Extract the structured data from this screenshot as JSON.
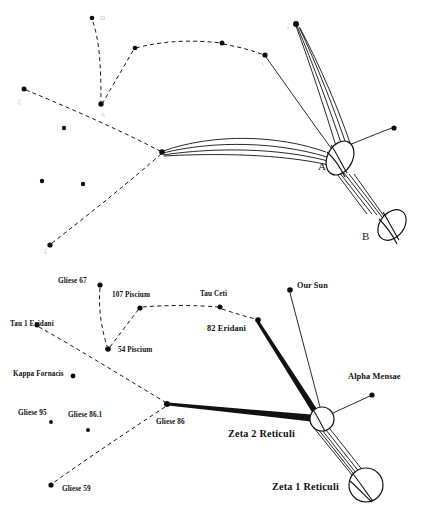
{
  "figure": {
    "background_color": "#ffffff",
    "ink_color": "#111111",
    "faint_ink_color": "#bdbdbd"
  },
  "upper_panel": {
    "name": "upper-sketch-panel",
    "object_labels": [
      {
        "id": "obj-a",
        "text": "A",
        "x": 318,
        "y": 170
      },
      {
        "id": "obj-b",
        "text": "B",
        "x": 362,
        "y": 240
      }
    ],
    "faint_labels": [
      {
        "id": "faint-d",
        "text": "D",
        "x": 100,
        "y": 20
      },
      {
        "id": "faint-zeta-left",
        "text": "ζ",
        "x": 18,
        "y": 104
      },
      {
        "id": "faint-c-bottom",
        "text": "ζ",
        "x": 44,
        "y": 253
      },
      {
        "id": "faint-upper-right-1",
        "text": "ι",
        "x": 287,
        "y": 30
      },
      {
        "id": "faint-upper-right-2",
        "text": "ι",
        "x": 262,
        "y": 66
      },
      {
        "id": "faint-node-low",
        "text": "η",
        "x": 101,
        "y": 116
      }
    ],
    "stars": [
      {
        "id": "u-star-1",
        "x": 92,
        "y": 18,
        "r": 2.3
      },
      {
        "id": "u-star-2",
        "x": 101,
        "y": 104,
        "r": 2.7
      },
      {
        "id": "u-star-3",
        "x": 135,
        "y": 48,
        "r": 2.3
      },
      {
        "id": "u-star-4",
        "x": 222,
        "y": 43,
        "r": 2.5
      },
      {
        "id": "u-star-5",
        "x": 265,
        "y": 55,
        "r": 2.6
      },
      {
        "id": "u-star-6",
        "x": 24,
        "y": 89,
        "r": 2.5
      },
      {
        "id": "u-star-7",
        "x": 64,
        "y": 128,
        "r": 2.2
      },
      {
        "id": "u-star-8",
        "x": 42,
        "y": 181,
        "r": 2.2
      },
      {
        "id": "u-star-9",
        "x": 83,
        "y": 184,
        "r": 2.2
      },
      {
        "id": "u-star-10",
        "x": 50,
        "y": 245,
        "r": 2.6
      },
      {
        "id": "u-star-11",
        "x": 162,
        "y": 152,
        "r": 2.8
      },
      {
        "id": "u-star-12",
        "x": 295,
        "y": 24,
        "r": 3.0
      },
      {
        "id": "u-star-13",
        "x": 394,
        "y": 128,
        "r": 2.6
      }
    ]
  },
  "lower_panel": {
    "name": "lower-star-map-panel",
    "stars": [
      {
        "id": "gliese-67",
        "label": "Gliese 67",
        "x": 100,
        "y": 285,
        "lx": 58,
        "ly": 283,
        "r": 2.6,
        "size": "small"
      },
      {
        "id": "piscium-107",
        "label": "107 Piscium",
        "x": 140,
        "y": 308,
        "lx": 112,
        "ly": 297,
        "r": 2.6,
        "size": "small"
      },
      {
        "id": "piscium-54",
        "label": "54 Piscium",
        "x": 108,
        "y": 349,
        "lx": 118,
        "ly": 352,
        "r": 2.8,
        "size": "small"
      },
      {
        "id": "tau-ceti",
        "label": "Tau Ceti",
        "x": 220,
        "y": 307,
        "lx": 200,
        "ly": 296,
        "r": 2.5,
        "size": "small"
      },
      {
        "id": "tau-1-eridani",
        "label": "Tau 1 Eridani",
        "x": 37,
        "y": 325,
        "lx": 10,
        "ly": 326,
        "r": 2.5,
        "size": "small"
      },
      {
        "id": "kappa-fornacis",
        "label": "Kappa Fornacis",
        "x": 73,
        "y": 376,
        "lx": 13,
        "ly": 376,
        "r": 2.4,
        "size": "small"
      },
      {
        "id": "gliese-95",
        "label": "Gliese 95",
        "x": 51,
        "y": 422,
        "lx": 18,
        "ly": 415,
        "r": 1.9,
        "size": "small"
      },
      {
        "id": "gliese-86-1",
        "label": "Gliese 86.1",
        "x": 88,
        "y": 430,
        "lx": 87,
        "ly": 417,
        "r": 2.0,
        "size": "small"
      },
      {
        "id": "gliese-86",
        "label": "Gliese 86",
        "x": 167,
        "y": 404,
        "lx": 156,
        "ly": 424,
        "r": 3.0,
        "size": "small"
      },
      {
        "id": "gliese-59",
        "label": "Gliese 59",
        "x": 51,
        "y": 485,
        "lx": 62,
        "ly": 491,
        "r": 2.6,
        "size": "small"
      },
      {
        "id": "eridani-82",
        "label": "82 Eridani",
        "x": 258,
        "y": 320,
        "lx": 207,
        "ly": 331,
        "r": 2.8,
        "size": "small"
      },
      {
        "id": "our-sun",
        "label": "Our Sun",
        "x": 290,
        "y": 290,
        "lx": 297,
        "ly": 288,
        "r": 2.8,
        "size": "small"
      },
      {
        "id": "alpha-mensae",
        "label": "Alpha Mensae",
        "x": 372,
        "y": 395,
        "lx": 353,
        "ly": 379,
        "r": 2.6,
        "size": "small"
      }
    ],
    "big_bodies": [
      {
        "id": "zeta-2-reticuli",
        "label": "Zeta 2 Reticuli",
        "x": 322,
        "y": 419,
        "r": 12,
        "lx": 228,
        "ly": 437
      },
      {
        "id": "zeta-1-reticuli",
        "label": "Zeta 1 Reticuli",
        "x": 366,
        "y": 485,
        "r": 17,
        "lx": 272,
        "ly": 490
      }
    ],
    "dashed_route": [
      "gliese-67",
      "54-piscium",
      "107-piscium",
      "tau-ceti",
      "82-eridani"
    ]
  }
}
